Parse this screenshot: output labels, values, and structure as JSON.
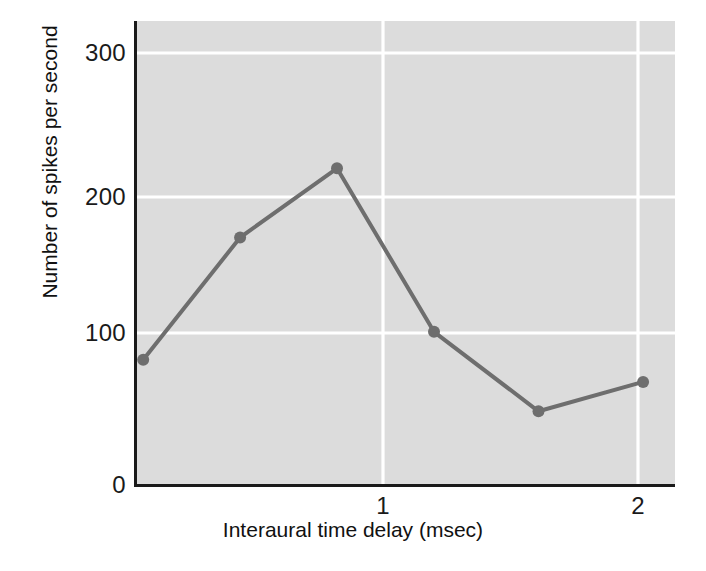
{
  "chart_data": {
    "type": "line",
    "title": "",
    "xlabel": "Interaural time delay (msec)",
    "ylabel": "Number of spikes per second",
    "xlim": [
      0.024,
      2.145
    ],
    "ylim": [
      0,
      315
    ],
    "xticks": [
      1,
      2
    ],
    "xticklabels": [
      "1",
      "2"
    ],
    "yticks": [
      0,
      100,
      200,
      300
    ],
    "yticklabels": [
      "0",
      "100",
      "200",
      "300"
    ],
    "grid": "white gridlines on gray plot background",
    "legend": "none",
    "series": [
      {
        "name": "Spike rate vs interaural time delay",
        "x": [
          0.06,
          0.44,
          0.82,
          1.2,
          1.61,
          2.02
        ],
        "values": [
          85,
          168,
          215,
          104,
          50,
          70
        ],
        "marker": "filled circle",
        "color": "#6e6e6e"
      }
    ],
    "colors": {
      "plot_background": "#dcdcdc",
      "gridline": "#ffffff",
      "line": "#6e6e6e",
      "marker": "#6e6e6e",
      "axis": "#1a1a1a",
      "text": "#111111",
      "page_background": "#ffffff"
    }
  },
  "axes": {
    "y_tick_labels": [
      "300",
      "200",
      "100",
      "0"
    ],
    "x_tick_labels": [
      "1",
      "2"
    ],
    "y_axis_title": "Number of spikes per second",
    "x_axis_title": "Interaural time delay (msec)"
  }
}
